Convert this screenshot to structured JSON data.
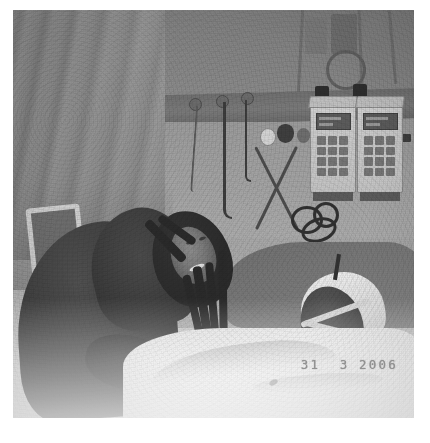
{
  "document": {
    "background_color": "#ffffff",
    "page_width": 430,
    "page_height": 443
  },
  "photo": {
    "kind": "photograph",
    "color_mode": "grayscale",
    "description": "Black-and-white hospital intensive-care photograph: a woman with long braided hair, wearing dark clothing, leans over and smiles beside a patient lying in a bed. Two IV infusion pumps with keypads stand against the back wall, IV bags and poles hang from above, a headwall unit with cables and gas outlets runs across the wall, and a privacy curtain hangs at the left. White bed linen fills the lower portion of the frame.",
    "frame": {
      "left": 13,
      "top": 10,
      "width": 401,
      "height": 408
    },
    "date_stamp": "31  3 2006",
    "date_stamp_color": "#8e8e8e",
    "regions": {
      "curtain": "privacy curtain with vertical folds, left side",
      "back_wall": "hospital back wall with horizontal headwall rail",
      "infusion_pumps": "two IV infusion pumps with display screens and keypads",
      "iv_poles": "IV poles and fluid bags suspended at the top right",
      "coiled_tubing": "dark coiled tubing and cables at centre right",
      "woman": "visitor with braided hair leaning over bed, smiling",
      "patient": "patient's head on pillow with oxygen mask strap and tubing",
      "bed_linen": "white sheet and blanket covering lower half of frame",
      "bed_rail": "light-coloured bed rail / chair frame at lower left"
    }
  },
  "caption": {
    "text": "",
    "visible": true
  }
}
